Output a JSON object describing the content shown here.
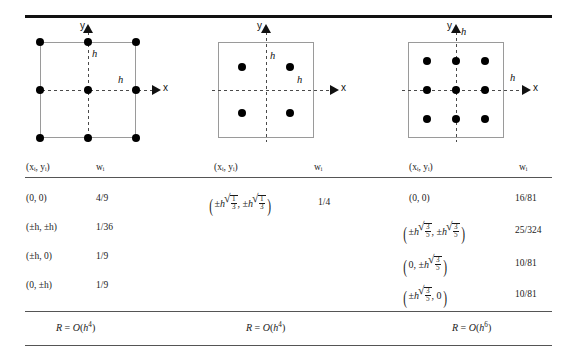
{
  "table": {
    "columns": [
      {
        "id": "col-1",
        "rule_name": "simpson-2d",
        "header": {
          "points": "(xᵢ, yᵢ)",
          "weights": "wᵢ"
        },
        "diagram": {
          "x_axis_label": "x",
          "y_axis_label": "y",
          "h_label_vertical": "h",
          "h_label_horizontal": "h",
          "node_count": 9,
          "node_layout": "3x3-on-square-corners-edges-and-center"
        },
        "rows": [
          {
            "point": "(0, 0)",
            "weight": "4/9"
          },
          {
            "point": "(±h, ±h)",
            "weight": "1/36"
          },
          {
            "point": "(±h, 0)",
            "weight": "1/9"
          },
          {
            "point": "(0, ±h)",
            "weight": "1/9"
          }
        ],
        "error": {
          "lhs": "R",
          "eq": "=",
          "order": "O(h⁴)",
          "text": "R = O(h⁴)"
        }
      },
      {
        "id": "col-2",
        "rule_name": "gauss-2-point-2d",
        "header": {
          "points": "(xᵢ, yᵢ)",
          "weights": "wᵢ"
        },
        "diagram": {
          "x_axis_label": "x",
          "y_axis_label": "y",
          "h_label_vertical": "h",
          "h_label_horizontal": "h",
          "node_count": 4,
          "node_layout": "2x2-interior"
        },
        "rows": [
          {
            "point_latex": "(±h√(1/3), ±h√(1/3))",
            "radicand_num": "1",
            "radicand_den": "3",
            "weight": "1/4"
          }
        ],
        "error": {
          "lhs": "R",
          "eq": "=",
          "order": "O(h⁴)",
          "text": "R = O(h⁴)"
        }
      },
      {
        "id": "col-3",
        "rule_name": "gauss-3-point-2d",
        "header": {
          "points": "(xᵢ, yᵢ)",
          "weights": "wᵢ"
        },
        "diagram": {
          "x_axis_label": "x",
          "y_axis_label": "y",
          "h_label_vertical": "h",
          "h_label_horizontal": "h",
          "node_count": 9,
          "node_layout": "3x3-interior"
        },
        "rows": [
          {
            "point": "(0, 0)",
            "weight": "16/81"
          },
          {
            "point_latex": "(±h√(3/5), ±h√(3/5))",
            "radicand_num": "3",
            "radicand_den": "5",
            "weight": "25/324"
          },
          {
            "point_latex": "(0, ±h√(3/5))",
            "radicand_num": "3",
            "radicand_den": "5",
            "weight": "10/81"
          },
          {
            "point_latex": "(±h√(3/5), 0)",
            "radicand_num": "3",
            "radicand_den": "5",
            "weight": "10/81"
          }
        ],
        "error": {
          "lhs": "R",
          "eq": "=",
          "order": "O(h⁶)",
          "text": "R = O(h⁶)"
        }
      }
    ]
  },
  "colors": {
    "rule_dark": "#111111",
    "rule_light": "#555555",
    "square_outline": "#9a9a9a",
    "axis_dash": "#4a4a4a",
    "node_fill": "#000000",
    "text": "#1a1a1a",
    "background": "#ffffff"
  }
}
